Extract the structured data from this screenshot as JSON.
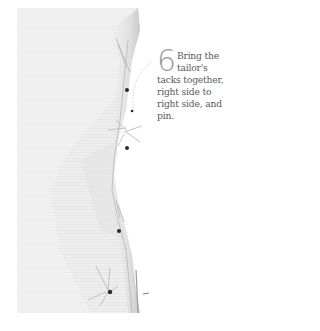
{
  "step": {
    "number": "6",
    "text": "Bring the tailor's tacks together, right side to right side, and pin."
  },
  "illustration": {
    "subject": "white fabric with tailor's tacks and pins",
    "fabric_color": "#ececec",
    "shadow_color": "#d0d0d0",
    "pin_head_color": "#2a2a2a",
    "thread_color": "#b8b8b8"
  }
}
